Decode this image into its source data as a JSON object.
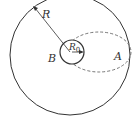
{
  "diagram": {
    "labels": {
      "outer_radius": "R",
      "inner_radius": "R",
      "inner_radius_sub": "0",
      "point_a": "A",
      "point_b": "B"
    },
    "colors": {
      "stroke": "#333333",
      "dashed": "#666666",
      "background": "#ffffff"
    }
  }
}
